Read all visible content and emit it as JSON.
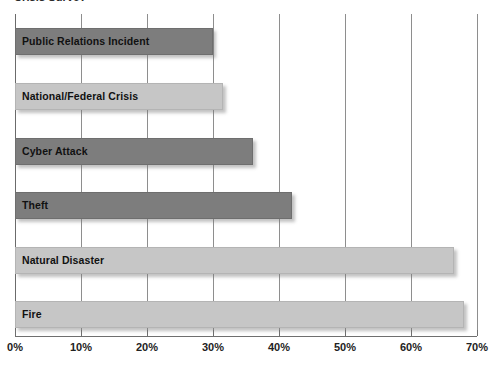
{
  "chart_data": {
    "type": "bar",
    "orientation": "horizontal",
    "title": "Crisis Survey",
    "xlabel": "",
    "ylabel": "",
    "xlim": [
      0,
      70
    ],
    "grid": true,
    "legend": "none",
    "categories": [
      "Public Relations Incident",
      "National/Federal Crisis",
      "Cyber Attack",
      "Theft",
      "Natural Disaster",
      "Fire"
    ],
    "values": [
      30,
      31.5,
      36,
      42,
      66.5,
      68
    ],
    "value_unit": "%",
    "xticks": [
      0,
      10,
      20,
      30,
      40,
      50,
      60,
      70
    ],
    "xtick_labels": [
      "0%",
      "10%",
      "20%",
      "30%",
      "40%",
      "50%",
      "60%",
      "70%"
    ],
    "bar_shades": [
      "dark",
      "light",
      "dark",
      "dark",
      "light",
      "light"
    ],
    "colors": {
      "bar_dark": "#7d7d7d",
      "bar_light": "#c6c6c6",
      "gridline": "#8e8e8e",
      "axis": "#6f6f6f",
      "label_text": "#111111",
      "background": "#ffffff"
    }
  }
}
